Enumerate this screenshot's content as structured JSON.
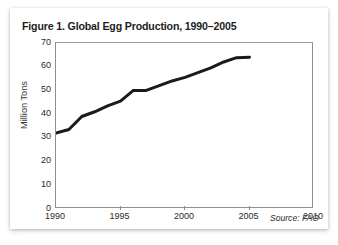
{
  "figure": {
    "title": "Figure 1. Global Egg Production, 1990–2005",
    "source_note": "Source: FAO"
  },
  "chart_data": {
    "type": "line",
    "title": "Figure 1. Global Egg Production, 1990–2005",
    "subtitle": "",
    "xlabel": "",
    "ylabel": "Million Tons",
    "x": [
      1990,
      1991,
      1992,
      1993,
      1994,
      1995,
      1996,
      1997,
      1998,
      1999,
      2000,
      2001,
      2002,
      2003,
      2004,
      2005
    ],
    "values": [
      32.0,
      33.5,
      39.0,
      41.0,
      43.5,
      45.5,
      50.0,
      50.0,
      52.0,
      54.0,
      55.5,
      57.5,
      59.5,
      62.0,
      63.8,
      64.0
    ],
    "series": [
      {
        "name": "Global Egg Production",
        "values": [
          32.0,
          33.5,
          39.0,
          41.0,
          43.5,
          45.5,
          50.0,
          50.0,
          52.0,
          54.0,
          55.5,
          57.5,
          59.5,
          62.0,
          63.8,
          64.0
        ],
        "color": "#1a1a1a",
        "line_width": 3
      }
    ],
    "xlim": [
      1990,
      2010
    ],
    "ylim": [
      0,
      70
    ],
    "x_ticks": [
      1990,
      1995,
      2000,
      2005,
      2010
    ],
    "x_tick_labels": [
      "1990",
      "1995",
      "2000",
      "2005",
      "2010"
    ],
    "y_ticks": [
      0,
      10,
      20,
      30,
      40,
      50,
      60,
      70
    ],
    "y_tick_labels": [
      "0",
      "10",
      "20",
      "30",
      "40",
      "50",
      "60",
      "70"
    ],
    "grid": false,
    "legend": "none",
    "annotations": [
      {
        "text": "Source: FAO",
        "position": "bottom-right",
        "style": "italic"
      }
    ]
  },
  "colors": {
    "line": "#1a1a1a",
    "axis": "#8e8e8e",
    "text": "#2a2a2a",
    "title": "#1d1d1d",
    "card_background": "#ffffff",
    "page_background": "#ffffff"
  }
}
